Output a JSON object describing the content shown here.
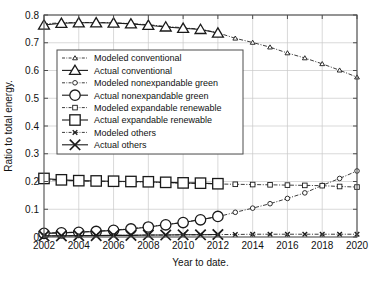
{
  "chart_data": {
    "type": "line",
    "title": "",
    "xlabel": "Year to date.",
    "ylabel": "Ratio to total energy.",
    "xlim": [
      2002,
      2020
    ],
    "ylim": [
      0,
      0.8
    ],
    "xticks": [
      2002,
      2004,
      2006,
      2008,
      2010,
      2012,
      2014,
      2016,
      2018,
      2020
    ],
    "xticklabels": [
      "2002",
      "2004",
      "2006",
      "2008",
      "2010",
      "2012",
      "2014",
      "2016",
      "2018",
      "2020"
    ],
    "yticks": [
      0,
      0.1,
      0.2,
      0.3,
      0.4,
      0.5,
      0.6,
      0.7,
      0.8
    ],
    "yticklabels": [
      "0",
      "0.1",
      "0.2",
      "0.3",
      "0.4",
      "0.5",
      "0.6",
      "0.7",
      "0.8"
    ],
    "grid": true,
    "legend_position": "upper left inside",
    "series": [
      {
        "name": "Modeled conventional",
        "marker": "triangle",
        "marker_size": "small",
        "line_style": "dash-dot",
        "x": [
          2002,
          2003,
          2004,
          2005,
          2006,
          2007,
          2008,
          2009,
          2010,
          2011,
          2012,
          2013,
          2014,
          2015,
          2016,
          2017,
          2018,
          2019,
          2020
        ],
        "values": [
          0.768,
          0.772,
          0.773,
          0.773,
          0.772,
          0.769,
          0.765,
          0.759,
          0.754,
          0.749,
          0.736,
          0.716,
          0.701,
          0.684,
          0.663,
          0.645,
          0.624,
          0.601,
          0.576
        ]
      },
      {
        "name": "Actual conventional",
        "marker": "triangle",
        "marker_size": "large",
        "line_style": "solid",
        "x": [
          2002,
          2003,
          2004,
          2005,
          2006,
          2007,
          2008,
          2009,
          2010,
          2011,
          2012
        ],
        "values": [
          0.764,
          0.77,
          0.772,
          0.772,
          0.771,
          0.768,
          0.763,
          0.757,
          0.752,
          0.748,
          0.735
        ]
      },
      {
        "name": "Modeled nonexpandable green",
        "marker": "circle",
        "marker_size": "small",
        "line_style": "dash-dot",
        "x": [
          2002,
          2003,
          2004,
          2005,
          2006,
          2007,
          2008,
          2009,
          2010,
          2011,
          2012,
          2013,
          2014,
          2015,
          2016,
          2017,
          2018,
          2019,
          2020
        ],
        "values": [
          0.014,
          0.016,
          0.018,
          0.021,
          0.025,
          0.03,
          0.037,
          0.045,
          0.053,
          0.063,
          0.073,
          0.089,
          0.104,
          0.12,
          0.139,
          0.159,
          0.186,
          0.211,
          0.238
        ]
      },
      {
        "name": "Actual nonexpandable green",
        "marker": "circle",
        "marker_size": "large",
        "line_style": "solid",
        "x": [
          2002,
          2003,
          2004,
          2005,
          2006,
          2007,
          2008,
          2009,
          2010,
          2011,
          2012
        ],
        "values": [
          0.013,
          0.015,
          0.017,
          0.02,
          0.024,
          0.029,
          0.036,
          0.044,
          0.052,
          0.062,
          0.074
        ]
      },
      {
        "name": "Modeled expandable renewable",
        "marker": "square",
        "marker_size": "small",
        "line_style": "dash-dot",
        "x": [
          2002,
          2003,
          2004,
          2005,
          2006,
          2007,
          2008,
          2009,
          2010,
          2011,
          2012,
          2013,
          2014,
          2015,
          2016,
          2017,
          2018,
          2019,
          2020
        ],
        "values": [
          0.207,
          0.204,
          0.202,
          0.201,
          0.2,
          0.199,
          0.198,
          0.196,
          0.194,
          0.193,
          0.191,
          0.19,
          0.189,
          0.188,
          0.187,
          0.186,
          0.185,
          0.182,
          0.18
        ]
      },
      {
        "name": "Actual expandable renewable",
        "marker": "square",
        "marker_size": "large",
        "line_style": "solid",
        "x": [
          2002,
          2003,
          2004,
          2005,
          2006,
          2007,
          2008,
          2009,
          2010,
          2011,
          2012
        ],
        "values": [
          0.211,
          0.206,
          0.203,
          0.202,
          0.201,
          0.2,
          0.199,
          0.197,
          0.195,
          0.194,
          0.192
        ]
      },
      {
        "name": "Modeled others",
        "marker": "x",
        "marker_size": "small",
        "line_style": "dash-dot",
        "x": [
          2002,
          2003,
          2004,
          2005,
          2006,
          2007,
          2008,
          2009,
          2010,
          2011,
          2012,
          2013,
          2014,
          2015,
          2016,
          2017,
          2018,
          2019,
          2020
        ],
        "values": [
          0.004,
          0.004,
          0.005,
          0.005,
          0.006,
          0.006,
          0.007,
          0.007,
          0.008,
          0.008,
          0.009,
          0.009,
          0.01,
          0.01,
          0.01,
          0.01,
          0.01,
          0.01,
          0.01
        ]
      },
      {
        "name": "Actual others",
        "marker": "x",
        "marker_size": "large",
        "line_style": "solid",
        "x": [
          2002,
          2003,
          2004,
          2005,
          2006,
          2007,
          2008,
          2009,
          2010,
          2011,
          2012
        ],
        "values": [
          0.004,
          0.004,
          0.005,
          0.005,
          0.006,
          0.006,
          0.007,
          0.007,
          0.008,
          0.008,
          0.009
        ]
      }
    ]
  },
  "style": {
    "line_color": "#1a1a1a",
    "grid_color": "#c8c8c8",
    "axis_color": "#4d4d4d",
    "background": "#ffffff",
    "legend_background": "#ffffff"
  }
}
